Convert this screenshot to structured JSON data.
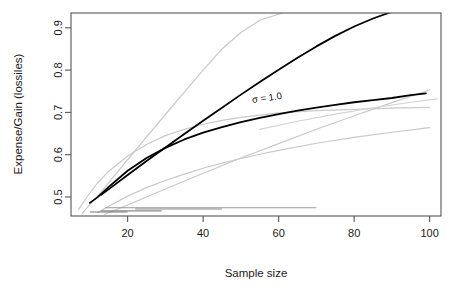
{
  "chart_data": {
    "type": "line",
    "title": "",
    "xlabel": "Sample size",
    "ylabel": "Expense/Gain (lossiles)",
    "xlim": [
      5,
      103
    ],
    "ylim": [
      0.455,
      0.935
    ],
    "xticks": [
      20,
      40,
      60,
      80,
      100
    ],
    "xtick_labels": [
      "20",
      "40",
      "60",
      "80",
      "100"
    ],
    "yticks": [
      0.5,
      0.6,
      0.7,
      0.8,
      0.9
    ],
    "ytick_labels": [
      "0.5",
      "0.6",
      "0.7",
      "0.8",
      "0.9"
    ],
    "grid": false,
    "legend": "none",
    "annotations": [
      {
        "text": "σ = 1.0",
        "x": 57,
        "y": 0.727,
        "rotation": -8
      }
    ],
    "series": [
      {
        "name": "sigma-1.0-linear-dark",
        "color": "#000000",
        "width": 1.8,
        "emphasis": "highlighted",
        "x": [
          13,
          16,
          20,
          25,
          30,
          35,
          40,
          45,
          50,
          55,
          60,
          65,
          70,
          75,
          80,
          85,
          90,
          95,
          100
        ],
        "values": [
          0.505,
          0.525,
          0.552,
          0.585,
          0.617,
          0.649,
          0.68,
          0.711,
          0.742,
          0.772,
          0.801,
          0.829,
          0.856,
          0.881,
          0.903,
          0.922,
          0.938,
          0.952,
          0.964
        ]
      },
      {
        "name": "sigma-1.0-log-dark",
        "color": "#000000",
        "width": 1.8,
        "emphasis": "highlighted",
        "x": [
          10,
          12,
          15,
          20,
          25,
          30,
          35,
          40,
          45,
          50,
          55,
          60,
          65,
          70,
          75,
          80,
          85,
          90,
          95,
          99
        ],
        "values": [
          0.486,
          0.499,
          0.524,
          0.562,
          0.592,
          0.616,
          0.636,
          0.652,
          0.665,
          0.677,
          0.687,
          0.696,
          0.704,
          0.711,
          0.718,
          0.724,
          0.729,
          0.734,
          0.741,
          0.745
        ]
      },
      {
        "name": "gray-steep-upper",
        "color": "#c9c9c9",
        "width": 1.2,
        "emphasis": "muted",
        "x": [
          8,
          10,
          13,
          16,
          20,
          25,
          30,
          35,
          40,
          45,
          50,
          55,
          61
        ],
        "values": [
          0.462,
          0.482,
          0.512,
          0.545,
          0.588,
          0.642,
          0.695,
          0.748,
          0.8,
          0.85,
          0.889,
          0.918,
          0.935
        ]
      },
      {
        "name": "gray-log-upper",
        "color": "#c9c9c9",
        "width": 1.2,
        "emphasis": "muted",
        "x": [
          7,
          9,
          12,
          15,
          20,
          25,
          30,
          35,
          40,
          45,
          50,
          60,
          70,
          80,
          90,
          100
        ],
        "values": [
          0.47,
          0.497,
          0.533,
          0.561,
          0.597,
          0.624,
          0.645,
          0.66,
          0.672,
          0.681,
          0.688,
          0.699,
          0.704,
          0.707,
          0.71,
          0.712
        ]
      },
      {
        "name": "gray-log-middle",
        "color": "#c9c9c9",
        "width": 1.2,
        "emphasis": "muted",
        "x": [
          12,
          15,
          20,
          25,
          30,
          35,
          40,
          45,
          50,
          55,
          60,
          70,
          80,
          90,
          100
        ],
        "values": [
          0.463,
          0.478,
          0.502,
          0.522,
          0.539,
          0.554,
          0.568,
          0.58,
          0.591,
          0.601,
          0.61,
          0.627,
          0.641,
          0.653,
          0.664
        ]
      },
      {
        "name": "gray-linear-lower",
        "color": "#c9c9c9",
        "width": 1.2,
        "emphasis": "muted",
        "x": [
          14,
          20,
          30,
          40,
          50,
          60,
          70,
          80,
          90,
          100
        ],
        "values": [
          0.459,
          0.481,
          0.519,
          0.556,
          0.592,
          0.626,
          0.66,
          0.692,
          0.723,
          0.753
        ]
      },
      {
        "name": "gray-shallow-tail",
        "color": "#d3d3d3",
        "width": 1.2,
        "emphasis": "muted",
        "x": [
          55,
          65,
          75,
          85,
          95,
          102
        ],
        "values": [
          0.66,
          0.679,
          0.696,
          0.711,
          0.724,
          0.732
        ]
      }
    ],
    "interval_bars": [
      {
        "name": "interval-bar-1",
        "x_start": 14,
        "x_end": 70,
        "y": 0.4745,
        "color": "#9a9a9a",
        "width": 1.0
      },
      {
        "name": "interval-bar-2",
        "x_start": 22,
        "x_end": 45,
        "y": 0.4715,
        "color": "#8c8c8c",
        "width": 1.2
      },
      {
        "name": "interval-bar-3",
        "x_start": 13,
        "x_end": 29,
        "y": 0.4672,
        "color": "#8c8c8c",
        "width": 1.3
      },
      {
        "name": "interval-bar-4",
        "x_start": 10,
        "x_end": 20,
        "y": 0.4645,
        "color": "#7d7d7d",
        "width": 1.2
      }
    ]
  },
  "axes": {
    "frame_color": "#555555",
    "tick_color": "#555555"
  }
}
